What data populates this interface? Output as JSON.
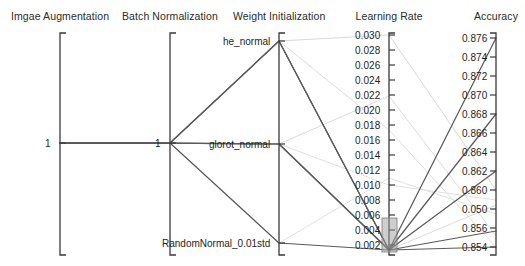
{
  "chart_data": {
    "type": "line",
    "subtype": "parallel-coordinates",
    "title": "",
    "grid": false,
    "legend": false,
    "axes": [
      {
        "name": "Imgae Augmentation",
        "kind": "categorical",
        "x": 60,
        "tick_labels": [
          "1"
        ],
        "tick_y": [
          143
        ]
      },
      {
        "name": "Batch Normalization",
        "kind": "categorical",
        "x": 170,
        "tick_labels": [
          "1"
        ],
        "tick_y": [
          143
        ]
      },
      {
        "name": "Weight Initialization",
        "kind": "categorical",
        "x": 279,
        "tick_labels": [
          "he_normal",
          "glorot_normal",
          "RandomNormal_0.01std"
        ],
        "tick_y": [
          41,
          144,
          243
        ]
      },
      {
        "name": "Learning Rate",
        "kind": "numeric",
        "x": 389,
        "range": [
          0.002,
          0.03
        ],
        "tick_labels": [
          "0.030",
          "0.028",
          "0.026",
          "0.024",
          "0.022",
          "0.020",
          "0.018",
          "0.016",
          "0.014",
          "0.012",
          "0.010",
          "0.008",
          "0.006",
          "0.004",
          "0.002"
        ],
        "tick_y": [
          35,
          50,
          65,
          80,
          95,
          110,
          125,
          140,
          155,
          170,
          185,
          200,
          215,
          230,
          245
        ]
      },
      {
        "name": "Accuracy",
        "kind": "numeric",
        "x": 496,
        "range": [
          0.854,
          0.876
        ],
        "tick_labels": [
          "0.876",
          "0.874",
          "0.872",
          "0.870",
          "0.868",
          "0.866",
          "0.864",
          "0.862",
          "0.860",
          "0.050",
          "0.856",
          "0.854"
        ],
        "tick_y": [
          38,
          57,
          76,
          95,
          114,
          133,
          152,
          171,
          190,
          209,
          228,
          247
        ]
      }
    ],
    "series": [
      {
        "name": "run-1",
        "state": "selected",
        "color": "#5a5a5a",
        "points": [
          {
            "x": 60,
            "y": 143
          },
          {
            "x": 170,
            "y": 143
          },
          {
            "x": 279,
            "y": 41
          },
          {
            "x": 389,
            "y": 250
          },
          {
            "x": 496,
            "y": 38
          }
        ]
      },
      {
        "name": "run-2",
        "state": "selected",
        "color": "#5a5a5a",
        "points": [
          {
            "x": 60,
            "y": 143
          },
          {
            "x": 170,
            "y": 143
          },
          {
            "x": 279,
            "y": 41
          },
          {
            "x": 389,
            "y": 250
          },
          {
            "x": 496,
            "y": 114
          }
        ]
      },
      {
        "name": "run-3",
        "state": "selected",
        "color": "#5a5a5a",
        "points": [
          {
            "x": 60,
            "y": 143
          },
          {
            "x": 170,
            "y": 143
          },
          {
            "x": 279,
            "y": 144
          },
          {
            "x": 389,
            "y": 250
          },
          {
            "x": 496,
            "y": 171
          }
        ]
      },
      {
        "name": "run-4",
        "state": "selected",
        "color": "#5a5a5a",
        "points": [
          {
            "x": 60,
            "y": 143
          },
          {
            "x": 170,
            "y": 143
          },
          {
            "x": 279,
            "y": 144
          },
          {
            "x": 389,
            "y": 250
          },
          {
            "x": 496,
            "y": 231
          }
        ]
      },
      {
        "name": "run-5",
        "state": "selected",
        "color": "#5a5a5a",
        "points": [
          {
            "x": 60,
            "y": 143
          },
          {
            "x": 170,
            "y": 143
          },
          {
            "x": 279,
            "y": 243
          },
          {
            "x": 389,
            "y": 250
          },
          {
            "x": 496,
            "y": 247
          }
        ]
      },
      {
        "name": "run-6",
        "state": "deselected",
        "color": "#d9d9d9",
        "points": [
          {
            "x": 60,
            "y": 143
          },
          {
            "x": 170,
            "y": 143
          },
          {
            "x": 279,
            "y": 41
          },
          {
            "x": 389,
            "y": 35
          },
          {
            "x": 496,
            "y": 190
          }
        ]
      },
      {
        "name": "run-7",
        "state": "deselected",
        "color": "#dedede",
        "points": [
          {
            "x": 60,
            "y": 143
          },
          {
            "x": 170,
            "y": 143
          },
          {
            "x": 279,
            "y": 41
          },
          {
            "x": 389,
            "y": 130
          },
          {
            "x": 496,
            "y": 247
          }
        ]
      },
      {
        "name": "run-8",
        "state": "deselected",
        "color": "#dcdcdc",
        "points": [
          {
            "x": 60,
            "y": 143
          },
          {
            "x": 170,
            "y": 143
          },
          {
            "x": 279,
            "y": 144
          },
          {
            "x": 389,
            "y": 96
          },
          {
            "x": 496,
            "y": 236
          }
        ]
      },
      {
        "name": "run-9",
        "state": "deselected",
        "color": "#e0e0e0",
        "points": [
          {
            "x": 60,
            "y": 143
          },
          {
            "x": 170,
            "y": 143
          },
          {
            "x": 279,
            "y": 144
          },
          {
            "x": 389,
            "y": 185
          },
          {
            "x": 496,
            "y": 200
          }
        ]
      },
      {
        "name": "run-10",
        "state": "deselected",
        "color": "#e2e2e2",
        "points": [
          {
            "x": 60,
            "y": 143
          },
          {
            "x": 170,
            "y": 143
          },
          {
            "x": 279,
            "y": 243
          },
          {
            "x": 389,
            "y": 178
          },
          {
            "x": 496,
            "y": 214
          }
        ]
      },
      {
        "name": "run-11",
        "state": "deselected",
        "color": "#dcdcdc",
        "points": [
          {
            "x": 60,
            "y": 143
          },
          {
            "x": 170,
            "y": 143
          },
          {
            "x": 279,
            "y": 41
          },
          {
            "x": 389,
            "y": 250
          },
          {
            "x": 496,
            "y": 205
          }
        ]
      }
    ],
    "brush": {
      "axis": "Learning Rate",
      "x": 382,
      "y": 218,
      "width": 15,
      "height": 34,
      "fill": "#9e9e9e",
      "label": ""
    }
  },
  "colors": {
    "axis": "#3a3a3a",
    "selected": "#5a5a5a",
    "deselected": "#dcdcdc",
    "brush": "#9e9e9e"
  }
}
